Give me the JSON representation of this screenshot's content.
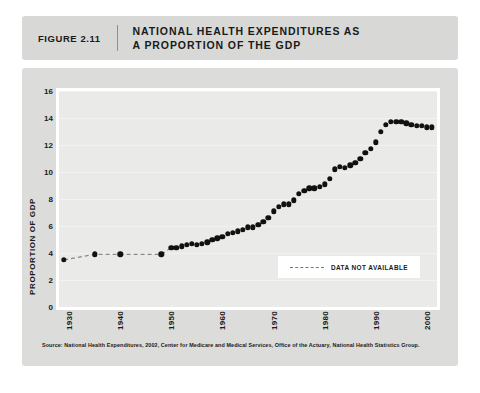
{
  "header": {
    "figure_number": "FIGURE 2.11",
    "title_line1": "NATIONAL HEALTH EXPENDITURES AS",
    "title_line2_prefix": "A PROPORTION OF THE ",
    "title_line2_bold": "GDP"
  },
  "legend": {
    "label": "DATA NOT AVAILABLE"
  },
  "source": {
    "text": "Source: National Health Expenditures, 2002, Center for Medicare and Medical Services, Office of the Actuary, National Health Statistics Group."
  },
  "colors": {
    "header_bg": "#d8d8d6",
    "card_bg": "#dcdcda",
    "plot_bg": "#eaeae8",
    "marker": "#111111",
    "grid": "#f2f2f0",
    "text": "#1a1a1a"
  },
  "chart_data": {
    "type": "scatter",
    "title": "NATIONAL HEALTH EXPENDITURES AS A PROPORTION OF THE GDP",
    "xlabel": "",
    "ylabel": "PROPORTION OF GDP",
    "xlim": [
      1928,
      2002
    ],
    "ylim": [
      0,
      16
    ],
    "yticks": [
      0,
      2,
      4,
      6,
      8,
      10,
      12,
      14,
      16
    ],
    "xticks": [
      1930,
      1940,
      1950,
      1960,
      1970,
      1980,
      1990,
      2000
    ],
    "grid": true,
    "legend_position": "inside-bottom-right",
    "legend_entries": [
      "DATA NOT AVAILABLE"
    ],
    "series": [
      {
        "name": "Sparse historical estimates (dashed connector)",
        "style": "markers-with-dashed-line",
        "x": [
          1929,
          1935,
          1940,
          1948
        ],
        "values": [
          3.5,
          3.9,
          3.9,
          3.9
        ]
      },
      {
        "name": "National health expenditures as share of GDP",
        "style": "markers",
        "x": [
          1950,
          1951,
          1952,
          1953,
          1954,
          1955,
          1956,
          1957,
          1958,
          1959,
          1960,
          1961,
          1962,
          1963,
          1964,
          1965,
          1966,
          1967,
          1968,
          1969,
          1970,
          1971,
          1972,
          1973,
          1974,
          1975,
          1976,
          1977,
          1978,
          1979,
          1980,
          1981,
          1982,
          1983,
          1984,
          1985,
          1986,
          1987,
          1988,
          1989,
          1990,
          1991,
          1992,
          1993,
          1994,
          1995,
          1996,
          1997,
          1998,
          1999,
          2000,
          2001
        ],
        "values": [
          4.4,
          4.4,
          4.5,
          4.6,
          4.7,
          4.6,
          4.7,
          4.8,
          5.0,
          5.1,
          5.2,
          5.4,
          5.5,
          5.6,
          5.7,
          5.9,
          5.9,
          6.1,
          6.3,
          6.6,
          7.1,
          7.4,
          7.6,
          7.6,
          7.9,
          8.4,
          8.6,
          8.8,
          8.8,
          8.9,
          9.1,
          9.5,
          10.2,
          10.4,
          10.3,
          10.5,
          10.7,
          11.0,
          11.4,
          11.7,
          12.2,
          13.0,
          13.5,
          13.7,
          13.7,
          13.7,
          13.6,
          13.5,
          13.4,
          13.4,
          13.3,
          13.3
        ]
      }
    ]
  }
}
